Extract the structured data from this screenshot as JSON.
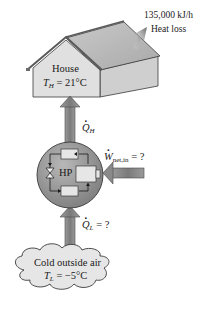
{
  "diagram": {
    "heat_loss": {
      "value": "135,000 kJ/h",
      "label": "Heat loss"
    },
    "house": {
      "label": "House",
      "temp_symbol": "T",
      "temp_sub": "H",
      "temp_value": " = 21°C"
    },
    "q_high": {
      "symbol": "Q",
      "sub": "H"
    },
    "heat_pump": {
      "label": "HP"
    },
    "work_input": {
      "symbol": "W",
      "sub": "net,in",
      "value": " = ?"
    },
    "q_low": {
      "symbol": "Q",
      "sub": "L",
      "value": " = ?"
    },
    "cold_source": {
      "label": "Cold outside air",
      "temp_symbol": "T",
      "temp_sub": "L",
      "temp_value": " = −5°C"
    },
    "colors": {
      "house_front": "#dedede",
      "house_side": "#cfcfcf",
      "roof": "#bdbdbd",
      "arrow": "#8c8c8c",
      "hp_circle": "#9a9a9a",
      "cloud": "#e6e6e6",
      "outline": "#3a3a3a"
    }
  }
}
